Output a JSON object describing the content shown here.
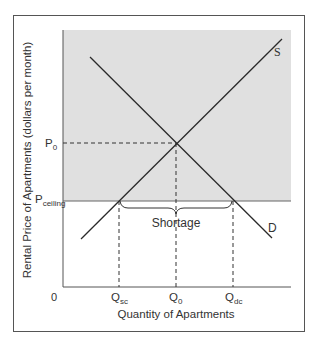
{
  "diagram": {
    "type": "supply-demand-price-ceiling",
    "y_axis_title": "Rental Price of Apartments (dollars per month)",
    "x_axis_title": "Quantity of Apartments",
    "origin_label": "0",
    "price_labels": {
      "p0_main": "P",
      "p0_sub": "0",
      "pceiling_main": "P",
      "pceiling_sub": "ceiling"
    },
    "quantity_labels": {
      "qsc_main": "Q",
      "qsc_sub": "sc",
      "q0_main": "Q",
      "q0_sub": "0",
      "qdc_main": "Q",
      "qdc_sub": "dc"
    },
    "curve_labels": {
      "supply": "S",
      "demand": "D"
    },
    "shortage_label": "Shortage",
    "colors": {
      "shaded_region": "#e0e0e0",
      "lines": "#2a2a2a",
      "border": "#555555",
      "text": "#333333"
    }
  }
}
